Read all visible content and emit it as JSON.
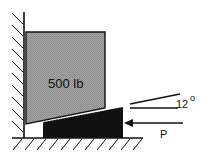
{
  "diagram": {
    "block": {
      "label": "500 lb",
      "fill": "#9a9a9a"
    },
    "wedge": {
      "fill": "#111111"
    },
    "force": {
      "label": "P"
    },
    "angle": {
      "value": "12",
      "unit": "°"
    }
  }
}
